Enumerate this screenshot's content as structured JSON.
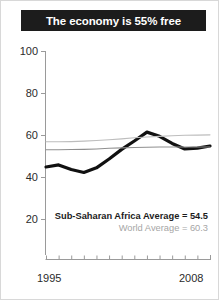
{
  "figure": {
    "title": "The economy is 55% free"
  },
  "chart_data": {
    "type": "line",
    "title": "The economy is 55% free",
    "xlabel": "",
    "ylabel": "",
    "xlim": [
      1995,
      2008
    ],
    "ylim": [
      10,
      100
    ],
    "yticks": [
      20,
      40,
      60,
      80,
      100
    ],
    "ytick_labels": [
      "20",
      "40",
      "60",
      "80",
      "100"
    ],
    "xticks": [
      1995,
      1996,
      1997,
      1998,
      1999,
      2000,
      2001,
      2002,
      2003,
      2004,
      2005,
      2006,
      2007,
      2008
    ],
    "xtick_labels_shown": [
      "1995",
      "2008"
    ],
    "grid": false,
    "legend": "none",
    "x": [
      1995,
      1996,
      1997,
      1998,
      1999,
      2000,
      2001,
      2002,
      2003,
      2004,
      2005,
      2006,
      2007,
      2008
    ],
    "series": [
      {
        "name": "Sub-Saharan Africa",
        "color": "#111111",
        "width": 3.2,
        "values": [
          45.0,
          46.0,
          43.8,
          42.4,
          44.6,
          48.8,
          53.4,
          57.4,
          61.6,
          59.6,
          56.2,
          53.6,
          54.0,
          55.0
        ]
      },
      {
        "name": "World Average",
        "color": "#bdbdbd",
        "width": 1.1,
        "values": [
          57.0,
          57.0,
          57.1,
          57.3,
          57.6,
          58.0,
          58.4,
          58.9,
          59.3,
          59.6,
          59.9,
          60.1,
          60.2,
          60.3
        ]
      },
      {
        "name": "Second reference line",
        "color": "#8f8f8f",
        "width": 1.1,
        "values": [
          53.2,
          53.2,
          53.3,
          53.4,
          53.6,
          53.9,
          54.1,
          54.3,
          54.4,
          54.5,
          54.5,
          54.5,
          54.5,
          54.5
        ]
      }
    ],
    "annotations": [
      {
        "name": "sub-saharan-africa-average",
        "text": "Sub-Saharan Africa Average = 54.5",
        "color": "#1c1c1c",
        "bold": true,
        "value": 54.5
      },
      {
        "name": "world-average",
        "text": "World Average = 60.3",
        "color": "#a6a6a6",
        "bold": false,
        "value": 60.3
      }
    ]
  },
  "axes": {
    "y_labels": [
      "100",
      "80",
      "60",
      "40",
      "20"
    ],
    "x_start_label": "1995",
    "x_end_label": "2008"
  }
}
